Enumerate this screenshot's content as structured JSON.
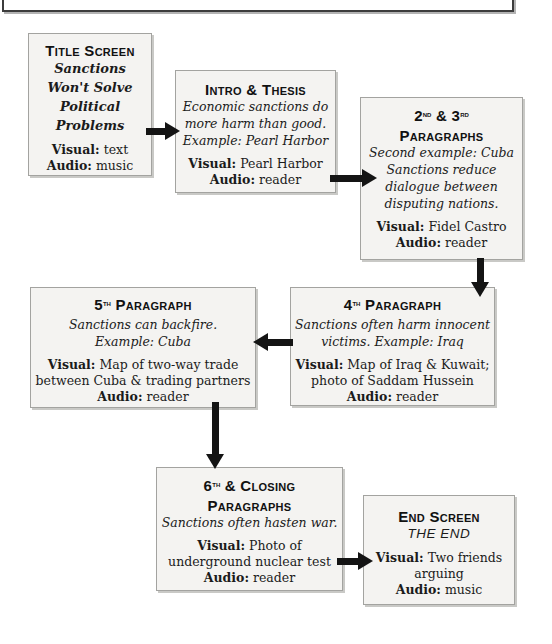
{
  "labels": {
    "visual": "Visual:",
    "audio": "Audio:"
  },
  "colors": {
    "box_fill": "#f4f3f1",
    "box_border": "#a3a3a0",
    "arrow": "#141414",
    "text": "#1b1b1b"
  },
  "boxes": [
    {
      "id": "title-screen",
      "heading": "Title Screen",
      "title_lines": [
        "Sanctions",
        "Won't Solve",
        "Political",
        "Problems"
      ],
      "visual_lines": [
        "text"
      ],
      "audio": "music"
    },
    {
      "id": "intro-thesis",
      "heading": "Intro & Thesis",
      "script_lines": [
        "Economic sanctions do",
        "more harm than good.",
        "Example: Pearl Harbor"
      ],
      "visual_lines": [
        "Pearl Harbor"
      ],
      "audio": "reader"
    },
    {
      "id": "paragraphs-2-3",
      "heading1": {
        "n1": "2",
        "o1": "nd",
        "amp": " & ",
        "n2": "3",
        "o2": "rd"
      },
      "heading2": "Paragraphs",
      "script_lines": [
        "Second example: Cuba",
        "Sanctions reduce",
        "dialogue between",
        "disputing nations."
      ],
      "visual_lines": [
        "Fidel Castro"
      ],
      "audio": "reader"
    },
    {
      "id": "paragraph-4",
      "heading1": {
        "n1": "4",
        "o1": "th",
        "rest": " Paragraph"
      },
      "script_lines": [
        "Sanctions often harm innocent",
        "victims. Example: Iraq"
      ],
      "visual_lines": [
        "Map of Iraq & Kuwait;",
        "photo of Saddam Hussein"
      ],
      "audio": "reader"
    },
    {
      "id": "paragraph-5",
      "heading1": {
        "n1": "5",
        "o1": "th",
        "rest": " Paragraph"
      },
      "script_lines": [
        "Sanctions can backfire.",
        "Example: Cuba"
      ],
      "visual_lines": [
        "Map of two-way trade",
        "between Cuba & trading partners"
      ],
      "audio": "reader"
    },
    {
      "id": "paragraphs-6-closing",
      "heading1": {
        "n1": "6",
        "o1": "th",
        "rest": " & Closing"
      },
      "heading2": "Paragraphs",
      "script_lines": [
        "Sanctions often hasten war."
      ],
      "visual_lines": [
        "Photo of",
        "underground nuclear test"
      ],
      "audio": "reader"
    },
    {
      "id": "end-screen",
      "heading": "End Screen",
      "end_text": "THE END",
      "visual_lines": [
        "Two friends",
        "arguing"
      ],
      "audio": "music"
    }
  ]
}
